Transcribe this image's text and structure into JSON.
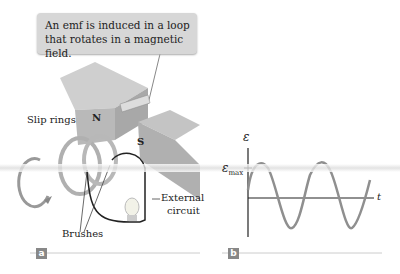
{
  "callout": {
    "line1": "An emf is induced in a loop",
    "line2": "that rotates in a magnetic field."
  },
  "labels": {
    "slip_rings": "Slip rings",
    "north": "N",
    "south": "S",
    "brushes": "Brushes",
    "external_line1": "External",
    "external_line2": "circuit"
  },
  "graph": {
    "y_symbol": "ε",
    "emax_main": "ε",
    "emax_sub": "max",
    "x_symbol": "t"
  },
  "panels": {
    "a": "a",
    "b": "b"
  },
  "colors": {
    "callout_bg": "#d7d7d7",
    "magnet": "#b5b5b5",
    "wave": "#8f8f8f",
    "tag": "#888888"
  }
}
